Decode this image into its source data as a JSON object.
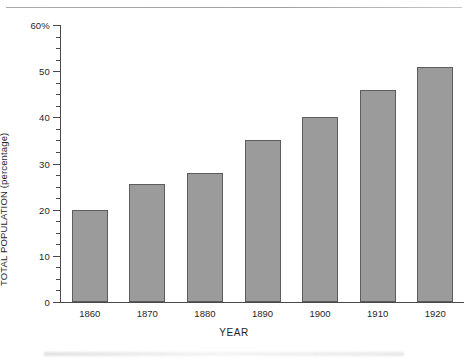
{
  "chart_data": {
    "type": "bar",
    "title": "",
    "subtitle": "",
    "xlabel": "YEAR",
    "ylabel": "TOTAL POPULATION (percentage)",
    "categories": [
      "1860",
      "1870",
      "1880",
      "1890",
      "1900",
      "1910",
      "1920"
    ],
    "values": [
      20,
      25.5,
      28,
      35,
      40,
      46,
      51
    ],
    "ylim": [
      0,
      60
    ],
    "xlim_note": "categorical",
    "ytick_major": [
      "0",
      "10",
      "20",
      "30",
      "40",
      "50",
      "60%"
    ],
    "ytick_major_values": [
      0,
      10,
      20,
      30,
      40,
      50,
      60
    ],
    "ytick_minor_step": 2.5,
    "grid": "off",
    "legend": "none",
    "legend_position": "none",
    "bar_fill_color": "#9b9b9b",
    "bar_edge_color": "#5c5c5c",
    "axis_color": "#4a4a4a",
    "annotations": []
  },
  "axes": {
    "y_axis_title": "TOTAL POPULATION (percentage)",
    "x_axis_title": "YEAR"
  }
}
